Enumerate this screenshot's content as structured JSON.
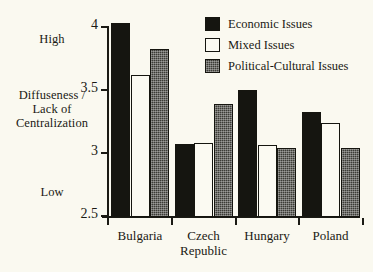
{
  "chart_data": {
    "type": "bar",
    "title": "",
    "xlabel": "",
    "ylabel": "Diffuseness /\nLack of\nCentralization",
    "ylim": [
      2.5,
      4.15
    ],
    "yticks": [
      2.5,
      3,
      3.5,
      4
    ],
    "ytick_labels": [
      "2.5",
      "3",
      "3.5",
      "4"
    ],
    "grid": false,
    "legend_position": "top-right",
    "axis_anchor_high": "High",
    "axis_anchor_low": "Low",
    "categories": [
      "Bulgaria",
      "Czech\nRepublic",
      "Hungary",
      "Poland"
    ],
    "series": [
      {
        "name": "Economic Issues",
        "key": "economic",
        "color": "#151510",
        "values": [
          4.04,
          3.08,
          3.51,
          3.33
        ]
      },
      {
        "name": "Mixed Issues",
        "key": "mixed",
        "color": "#fbfaf2",
        "values": [
          3.63,
          3.09,
          3.07,
          3.25
        ]
      },
      {
        "name": "Political-Cultural Issues",
        "key": "political",
        "color": "#3c3c36",
        "values": [
          3.83,
          3.4,
          3.05,
          3.05
        ]
      }
    ]
  },
  "style": {
    "background": "#faf9f0",
    "ink": "#1a1a14"
  }
}
